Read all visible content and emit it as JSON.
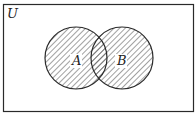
{
  "diagram": {
    "type": "venn",
    "universe_label": "U",
    "sets": [
      {
        "label": "A",
        "cx": 76,
        "cy": 58,
        "r": 31
      },
      {
        "label": "B",
        "cx": 122,
        "cy": 58,
        "r": 31
      }
    ],
    "shaded_region": "A ∪ B",
    "colors": {
      "stroke": "#2a2a2a",
      "hatch": "#444444",
      "background": "#ffffff"
    }
  }
}
